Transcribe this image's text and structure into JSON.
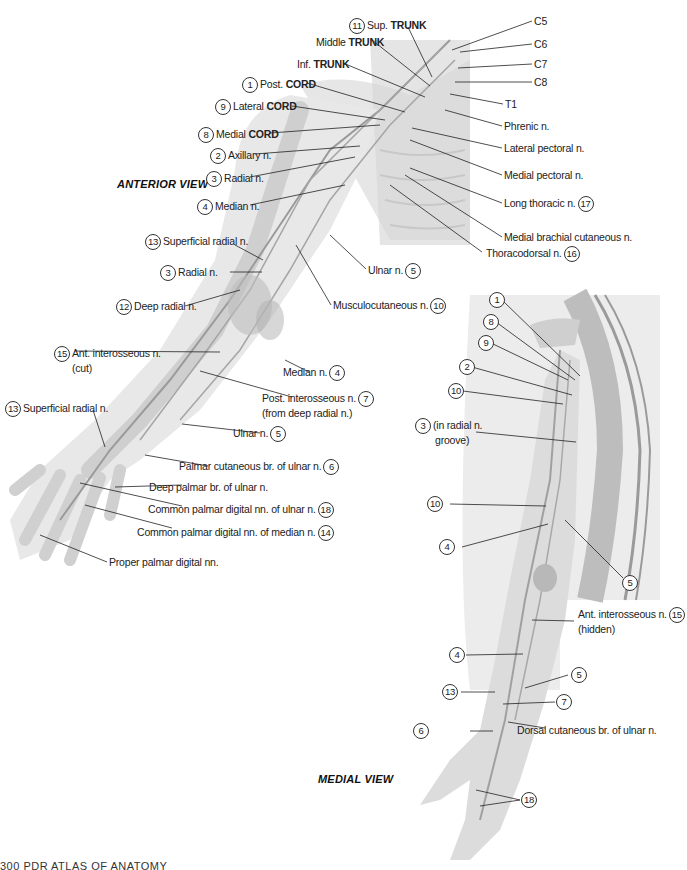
{
  "figure": {
    "views": {
      "anterior": "ANTERIOR VIEW",
      "medial": "MEDIAL VIEW"
    },
    "footer": "300   PDR ATLAS OF ANATOMY",
    "colors": {
      "background": "#ffffff",
      "skin_silhouette": "#e6e6e6",
      "structure_gray": "#b8b8b8",
      "leader_line": "#222222",
      "panel_gray": "#ececec"
    },
    "anterior_labels": [
      {
        "num": "11",
        "pre": "Sup. ",
        "bold": "TRUNK",
        "post": ""
      },
      {
        "num": "",
        "pre": "Middle ",
        "bold": "TRUNK",
        "post": ""
      },
      {
        "num": "",
        "pre": "Inf. ",
        "bold": "TRUNK",
        "post": ""
      },
      {
        "num": "1",
        "pre": "Post. ",
        "bold": "CORD",
        "post": ""
      },
      {
        "num": "9",
        "pre": "Lateral ",
        "bold": "CORD",
        "post": ""
      },
      {
        "num": "8",
        "pre": "Medial ",
        "bold": "CORD",
        "post": ""
      },
      {
        "num": "2",
        "pre": "Axillary n.",
        "bold": "",
        "post": ""
      },
      {
        "num": "3",
        "pre": "Radial n.",
        "bold": "",
        "post": ""
      },
      {
        "num": "4",
        "pre": "Median n.",
        "bold": "",
        "post": ""
      },
      {
        "num": "13",
        "pre": "Superficial radial n.",
        "bold": "",
        "post": ""
      },
      {
        "num": "3",
        "pre": "Radial n.",
        "bold": "",
        "post": ""
      },
      {
        "num": "12",
        "pre": "Deep radial n.",
        "bold": "",
        "post": ""
      },
      {
        "num": "15",
        "pre": "Ant. interosseous n.",
        "bold": "",
        "post": "(cut)"
      },
      {
        "num": "13",
        "pre": "Superficial radial n.",
        "bold": "",
        "post": ""
      }
    ],
    "anterior_right_labels": [
      {
        "text": "C5",
        "num": ""
      },
      {
        "text": "C6",
        "num": ""
      },
      {
        "text": "C7",
        "num": ""
      },
      {
        "text": "C8",
        "num": ""
      },
      {
        "text": "T1",
        "num": ""
      },
      {
        "text": "Phrenic n.",
        "num": ""
      },
      {
        "text": "Lateral pectoral n.",
        "num": ""
      },
      {
        "text": "Medial pectoral n.",
        "num": ""
      },
      {
        "text": "Long thoracic n.",
        "num": "17"
      },
      {
        "text": "Medial brachial cutaneous n.",
        "num": ""
      },
      {
        "text": "Thoracodorsal n.",
        "num": "16"
      },
      {
        "text": "Ulnar n.",
        "num": "5"
      },
      {
        "text": "Musculocutaneous n.",
        "num": "10"
      },
      {
        "text": "Median n.",
        "num": "4"
      },
      {
        "text": "Post. interosseous n.",
        "num": "7",
        "line2": "(from deep radial n.)"
      },
      {
        "text": "Ulnar n.",
        "num": "5"
      },
      {
        "text": "Palmar cutaneous br. of ulnar n.",
        "num": "6"
      },
      {
        "text": "Deep palmar br. of ulnar n.",
        "num": ""
      },
      {
        "text": "Common palmar digital nn. of ulnar n.",
        "num": "18"
      },
      {
        "text": "Common palmar digital nn. of median n.",
        "num": "14"
      },
      {
        "text": "Proper palmar digital nn.",
        "num": ""
      }
    ],
    "medial_labels": [
      {
        "num": "1",
        "text": ""
      },
      {
        "num": "8",
        "text": ""
      },
      {
        "num": "9",
        "text": ""
      },
      {
        "num": "2",
        "text": ""
      },
      {
        "num": "10",
        "text": ""
      },
      {
        "num": "3",
        "text": "(in radial n.",
        "line2": "groove)"
      },
      {
        "num": "10",
        "text": ""
      },
      {
        "num": "4",
        "text": ""
      },
      {
        "num": "5",
        "text": ""
      },
      {
        "num": "15",
        "text": "Ant. interosseous n.",
        "line2": "(hidden)"
      },
      {
        "num": "4",
        "text": ""
      },
      {
        "num": "5",
        "text": ""
      },
      {
        "num": "13",
        "text": ""
      },
      {
        "num": "7",
        "text": ""
      },
      {
        "num": "6",
        "text": "Dorsal cutaneous br. of ulnar n."
      },
      {
        "num": "18",
        "text": ""
      }
    ]
  }
}
